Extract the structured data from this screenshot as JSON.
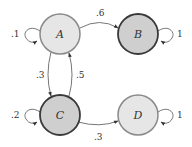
{
  "diagram": {
    "type": "markov-chain",
    "nodes": [
      {
        "id": "A",
        "label": "A",
        "cx": 60,
        "cy": 34,
        "fill": "#e6e6e6",
        "stroke": "#8a8a8a",
        "absorbing": false
      },
      {
        "id": "B",
        "label": "B",
        "cx": 138,
        "cy": 34,
        "fill": "#cfcfcf",
        "stroke": "#3a3a3a",
        "absorbing": true
      },
      {
        "id": "C",
        "label": "C",
        "cx": 60,
        "cy": 115,
        "fill": "#cfcfcf",
        "stroke": "#3a3a3a",
        "absorbing": false
      },
      {
        "id": "D",
        "label": "D",
        "cx": 138,
        "cy": 115,
        "fill": "#e6e6e6",
        "stroke": "#8a8a8a",
        "absorbing": true
      }
    ],
    "edges": [
      {
        "from": "A",
        "to": "A",
        "label": ".1"
      },
      {
        "from": "A",
        "to": "B",
        "label": ".6"
      },
      {
        "from": "A",
        "to": "C",
        "label": ".3"
      },
      {
        "from": "B",
        "to": "B",
        "label": "1"
      },
      {
        "from": "C",
        "to": "A",
        "label": ".5"
      },
      {
        "from": "C",
        "to": "C",
        "label": ".2"
      },
      {
        "from": "C",
        "to": "D",
        "label": ".3"
      },
      {
        "from": "D",
        "to": "D",
        "label": "1"
      }
    ]
  }
}
